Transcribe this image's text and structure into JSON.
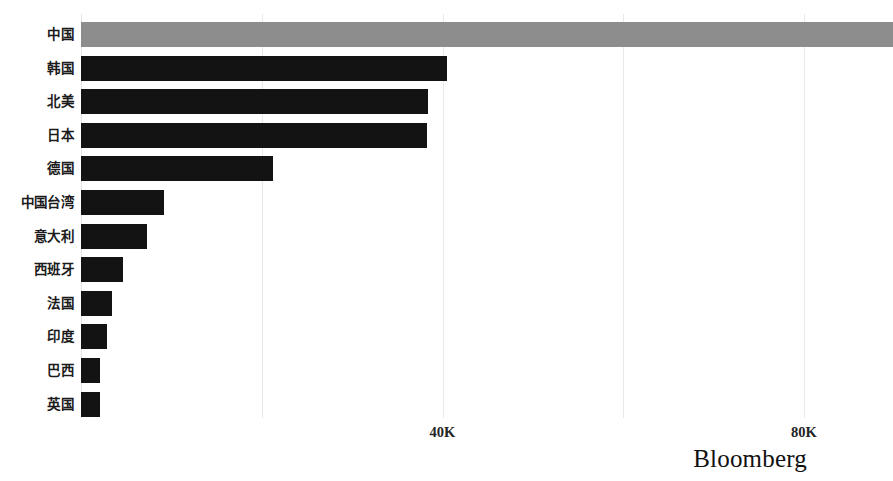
{
  "chart_data": {
    "type": "bar",
    "orientation": "horizontal",
    "title": "",
    "subtitle": "",
    "xlabel": "",
    "ylabel": "",
    "categories": [
      "中国",
      "韩国",
      "北美",
      "日本",
      "德国",
      "中国台湾",
      "意大利",
      "西班牙",
      "法国",
      "印度",
      "巴西",
      "英国"
    ],
    "values": [
      89800,
      40500,
      38400,
      38300,
      21300,
      9200,
      7350,
      4600,
      3400,
      2850,
      2100,
      2050
    ],
    "xlim": [
      0,
      90000
    ],
    "xticks": [
      0,
      20000,
      40000,
      60000,
      80000
    ],
    "xtick_labels": [
      "",
      "",
      "40K",
      "",
      "80K"
    ],
    "grid": true,
    "grid_axis": "x",
    "legend": "none",
    "highlight_category": "中国",
    "bar_color": "#131313",
    "highlight_color": "#8d8d8d",
    "gridline_color": "#e9e9e9",
    "background_color": "#ffffff"
  },
  "branding": {
    "logo_text": "Bloomberg"
  }
}
